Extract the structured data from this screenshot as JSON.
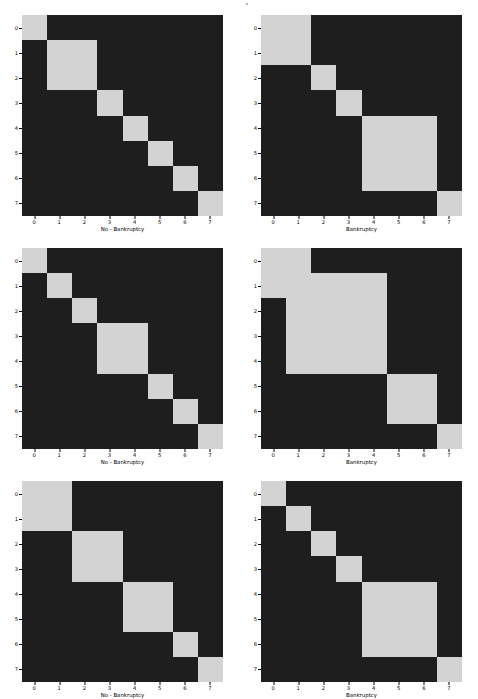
{
  "figure": {
    "width": 478,
    "height": 699,
    "background": "#ffffff",
    "block_color": "#d3d3d3",
    "background_cell_color": "#1e1e1e",
    "tick_color": "#000000",
    "rows": 3,
    "cols": 2
  },
  "axis": {
    "x_ticks": [
      "0",
      "1",
      "2",
      "3",
      "4",
      "5",
      "6",
      "7"
    ],
    "y_ticks": [
      "0",
      "1",
      "2",
      "3",
      "4",
      "5",
      "6",
      "7"
    ],
    "n": 8
  },
  "labels": {
    "no_bankruptcy": "No - Bankruptcy",
    "bankruptcy": "Bankruptcy"
  },
  "chart_data": {
    "type": "heatmap",
    "title": "",
    "xlabel": "",
    "ylabel": "",
    "axis_range": [
      -0.5,
      7.5
    ],
    "grid": false,
    "legend": null,
    "colormap": {
      "0": "#1e1e1e",
      "1": "#d3d3d3"
    },
    "panels": [
      {
        "index": 0,
        "position": "top-left",
        "xlabel": "No - Bankruptcy",
        "x_ticks": [
          "0",
          "1",
          "2",
          "3",
          "4",
          "5",
          "6",
          "7"
        ],
        "y_ticks": [
          "0",
          "1",
          "2",
          "3",
          "4",
          "5",
          "6",
          "7"
        ],
        "blocks": [
          [
            0,
            0
          ],
          [
            1,
            2
          ],
          [
            3,
            3
          ],
          [
            4,
            4
          ],
          [
            5,
            5
          ],
          [
            6,
            6
          ],
          [
            7,
            7
          ]
        ],
        "matrix": [
          [
            1,
            0,
            0,
            0,
            0,
            0,
            0,
            0
          ],
          [
            0,
            1,
            1,
            0,
            0,
            0,
            0,
            0
          ],
          [
            0,
            1,
            1,
            0,
            0,
            0,
            0,
            0
          ],
          [
            0,
            0,
            0,
            1,
            0,
            0,
            0,
            0
          ],
          [
            0,
            0,
            0,
            0,
            1,
            0,
            0,
            0
          ],
          [
            0,
            0,
            0,
            0,
            0,
            1,
            0,
            0
          ],
          [
            0,
            0,
            0,
            0,
            0,
            0,
            1,
            0
          ],
          [
            0,
            0,
            0,
            0,
            0,
            0,
            0,
            1
          ]
        ]
      },
      {
        "index": 1,
        "position": "top-right",
        "xlabel": "Bankruptcy",
        "x_ticks": [
          "0",
          "1",
          "2",
          "3",
          "4",
          "5",
          "6",
          "7"
        ],
        "y_ticks": [
          "0",
          "1",
          "2",
          "3",
          "4",
          "5",
          "6",
          "7"
        ],
        "blocks": [
          [
            0,
            1
          ],
          [
            2,
            2
          ],
          [
            3,
            3
          ],
          [
            4,
            6
          ],
          [
            7,
            7
          ]
        ],
        "matrix": [
          [
            1,
            1,
            0,
            0,
            0,
            0,
            0,
            0
          ],
          [
            1,
            1,
            0,
            0,
            0,
            0,
            0,
            0
          ],
          [
            0,
            0,
            1,
            0,
            0,
            0,
            0,
            0
          ],
          [
            0,
            0,
            0,
            1,
            0,
            0,
            0,
            0
          ],
          [
            0,
            0,
            0,
            0,
            1,
            1,
            1,
            0
          ],
          [
            0,
            0,
            0,
            0,
            1,
            1,
            1,
            0
          ],
          [
            0,
            0,
            0,
            0,
            1,
            1,
            1,
            0
          ],
          [
            0,
            0,
            0,
            0,
            0,
            0,
            0,
            1
          ]
        ]
      },
      {
        "index": 2,
        "position": "middle-left",
        "xlabel": "No - Bankruptcy",
        "x_ticks": [
          "0",
          "1",
          "2",
          "3",
          "4",
          "5",
          "6",
          "7"
        ],
        "y_ticks": [
          "0",
          "1",
          "2",
          "3",
          "4",
          "5",
          "6",
          "7"
        ],
        "blocks": [
          [
            0,
            0
          ],
          [
            1,
            1
          ],
          [
            2,
            2
          ],
          [
            3,
            4
          ],
          [
            5,
            5
          ],
          [
            6,
            6
          ],
          [
            7,
            7
          ]
        ],
        "matrix": [
          [
            1,
            0,
            0,
            0,
            0,
            0,
            0,
            0
          ],
          [
            0,
            1,
            0,
            0,
            0,
            0,
            0,
            0
          ],
          [
            0,
            0,
            1,
            0,
            0,
            0,
            0,
            0
          ],
          [
            0,
            0,
            0,
            1,
            1,
            0,
            0,
            0
          ],
          [
            0,
            0,
            0,
            1,
            1,
            0,
            0,
            0
          ],
          [
            0,
            0,
            0,
            0,
            0,
            1,
            0,
            0
          ],
          [
            0,
            0,
            0,
            0,
            0,
            0,
            1,
            0
          ],
          [
            0,
            0,
            0,
            0,
            0,
            0,
            0,
            1
          ]
        ]
      },
      {
        "index": 3,
        "position": "middle-right",
        "xlabel": "Bankruptcy",
        "x_ticks": [
          "0",
          "1",
          "2",
          "3",
          "4",
          "5",
          "6",
          "7"
        ],
        "y_ticks": [
          "0",
          "1",
          "2",
          "3",
          "4",
          "5",
          "6",
          "7"
        ],
        "blocks": [
          [
            0,
            1
          ],
          [
            1,
            4
          ],
          [
            5,
            6
          ],
          [
            7,
            7
          ]
        ],
        "matrix": [
          [
            1,
            1,
            0,
            0,
            0,
            0,
            0,
            0
          ],
          [
            1,
            1,
            1,
            1,
            1,
            0,
            0,
            0
          ],
          [
            0,
            1,
            1,
            1,
            1,
            0,
            0,
            0
          ],
          [
            0,
            1,
            1,
            1,
            1,
            0,
            0,
            0
          ],
          [
            0,
            1,
            1,
            1,
            1,
            0,
            0,
            0
          ],
          [
            0,
            0,
            0,
            0,
            0,
            1,
            1,
            0
          ],
          [
            0,
            0,
            0,
            0,
            0,
            1,
            1,
            0
          ],
          [
            0,
            0,
            0,
            0,
            0,
            0,
            0,
            1
          ]
        ]
      },
      {
        "index": 4,
        "position": "bottom-left",
        "xlabel": "No - Bankruptcy",
        "x_ticks": [
          "0",
          "1",
          "2",
          "3",
          "4",
          "5",
          "6",
          "7"
        ],
        "y_ticks": [
          "0",
          "1",
          "2",
          "3",
          "4",
          "5",
          "6",
          "7"
        ],
        "blocks": [
          [
            0,
            1
          ],
          [
            2,
            3
          ],
          [
            4,
            5
          ],
          [
            6,
            6
          ],
          [
            7,
            7
          ]
        ],
        "matrix": [
          [
            1,
            1,
            0,
            0,
            0,
            0,
            0,
            0
          ],
          [
            1,
            1,
            0,
            0,
            0,
            0,
            0,
            0
          ],
          [
            0,
            0,
            1,
            1,
            0,
            0,
            0,
            0
          ],
          [
            0,
            0,
            1,
            1,
            0,
            0,
            0,
            0
          ],
          [
            0,
            0,
            0,
            0,
            1,
            1,
            0,
            0
          ],
          [
            0,
            0,
            0,
            0,
            1,
            1,
            0,
            0
          ],
          [
            0,
            0,
            0,
            0,
            0,
            0,
            1,
            0
          ],
          [
            0,
            0,
            0,
            0,
            0,
            0,
            0,
            1
          ]
        ]
      },
      {
        "index": 5,
        "position": "bottom-right",
        "xlabel": "Bankruptcy",
        "x_ticks": [
          "0",
          "1",
          "2",
          "3",
          "4",
          "5",
          "6",
          "7"
        ],
        "y_ticks": [
          "0",
          "1",
          "2",
          "3",
          "4",
          "5",
          "6",
          "7"
        ],
        "blocks": [
          [
            0,
            0
          ],
          [
            1,
            1
          ],
          [
            2,
            2
          ],
          [
            3,
            3
          ],
          [
            4,
            6
          ],
          [
            7,
            7
          ]
        ],
        "matrix": [
          [
            1,
            0,
            0,
            0,
            0,
            0,
            0,
            0
          ],
          [
            0,
            1,
            0,
            0,
            0,
            0,
            0,
            0
          ],
          [
            0,
            0,
            1,
            0,
            0,
            0,
            0,
            0
          ],
          [
            0,
            0,
            0,
            1,
            0,
            0,
            0,
            0
          ],
          [
            0,
            0,
            0,
            0,
            1,
            1,
            1,
            0
          ],
          [
            0,
            0,
            0,
            0,
            1,
            1,
            1,
            0
          ],
          [
            0,
            0,
            0,
            0,
            1,
            1,
            1,
            0
          ],
          [
            0,
            0,
            0,
            0,
            0,
            0,
            0,
            1
          ]
        ]
      }
    ]
  }
}
